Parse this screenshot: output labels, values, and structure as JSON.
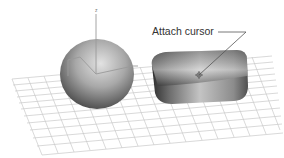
{
  "figure": {
    "axis_label": "z",
    "callout": {
      "label": "Attach cursor",
      "line_color": "#555555"
    },
    "objects": [
      {
        "name": "sphere",
        "type": "sphere",
        "shade_light": "#d8d8d8",
        "shade_dark": "#3c3c3c"
      },
      {
        "name": "chamfer-box",
        "type": "rounded-box",
        "shade_light": "#e4e4e4",
        "shade_dark": "#333333"
      }
    ],
    "grid": {
      "color": "#c8c8c8",
      "visible": true
    },
    "colors": {
      "background": "#ffffff",
      "text": "#333333",
      "gizmo": "#9a9a9a"
    }
  }
}
